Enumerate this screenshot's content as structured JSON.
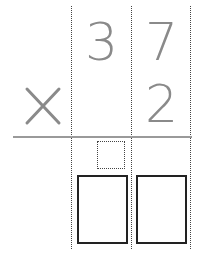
{
  "problem": {
    "operator": "×",
    "multiplicand_digits": [
      "3",
      "7"
    ],
    "multiplier_digits": [
      "2"
    ]
  },
  "answer": {
    "carry_box": "",
    "boxes": [
      "",
      ""
    ]
  },
  "colors": {
    "digit": "#8a8a8a",
    "rule": "#9a9a9a",
    "box_border": "#222222",
    "guide_line": "#444444"
  }
}
